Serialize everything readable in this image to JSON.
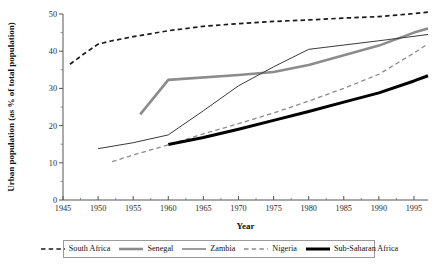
{
  "chart_data": {
    "type": "line",
    "title": "",
    "xlabel": "Year",
    "ylabel": "Urban population (as % of total population)",
    "xlim": [
      1945,
      1997
    ],
    "ylim": [
      0,
      50
    ],
    "xticks": [
      1945,
      1950,
      1955,
      1960,
      1965,
      1970,
      1975,
      1980,
      1985,
      1990,
      1995
    ],
    "xtick_labels": [
      "1945",
      "1950",
      "1955",
      "1960",
      "1965",
      "1970",
      "1975",
      "1980",
      "1985",
      "1990",
      "1995"
    ],
    "yticks": [
      0,
      10,
      20,
      30,
      40,
      50
    ],
    "ytick_labels": [
      "0",
      "10",
      "20",
      "30",
      "40",
      "50"
    ],
    "minor_ticks": true,
    "grid": false,
    "legend_position": "bottom",
    "series": [
      {
        "name": "South Africa",
        "color": "#1a1a1a",
        "style": "dashed",
        "width": 1.7,
        "x": [
          1946,
          1948,
          1950,
          1952,
          1955,
          1960,
          1965,
          1970,
          1975,
          1980,
          1985,
          1990,
          1995,
          1997
        ],
        "values": [
          36.5,
          39.3,
          41.9,
          42.8,
          43.9,
          45.5,
          46.7,
          47.4,
          48.0,
          48.4,
          48.9,
          49.3,
          50.1,
          50.5
        ]
      },
      {
        "name": "Senegal",
        "color": "#8c8c8c",
        "style": "solid",
        "width": 2.6,
        "x": [
          1956,
          1960,
          1970,
          1975,
          1980,
          1990,
          1995,
          1997
        ],
        "values": [
          23.0,
          32.3,
          33.6,
          34.4,
          36.3,
          41.5,
          45.0,
          46.1
        ]
      },
      {
        "name": "Zambia",
        "color": "#3a3a3a",
        "style": "solid",
        "width": 1.0,
        "x": [
          1950,
          1955,
          1960,
          1965,
          1970,
          1975,
          1980,
          1990,
          1995,
          1997
        ],
        "values": [
          13.8,
          15.4,
          17.5,
          24.0,
          30.7,
          35.8,
          40.5,
          42.8,
          44.0,
          44.5
        ]
      },
      {
        "name": "Nigeria",
        "color": "#8c8c8c",
        "style": "dashed",
        "width": 1.3,
        "x": [
          1952,
          1955,
          1960,
          1965,
          1970,
          1975,
          1980,
          1985,
          1990,
          1995,
          1997
        ],
        "values": [
          10.3,
          12.1,
          14.8,
          17.8,
          20.5,
          23.4,
          26.6,
          30.0,
          33.8,
          39.5,
          42.0
        ]
      },
      {
        "name": "Sub-Saharan Africa",
        "color": "#000000",
        "style": "solid",
        "width": 3.0,
        "x": [
          1960,
          1965,
          1970,
          1975,
          1980,
          1985,
          1990,
          1995,
          1997
        ],
        "values": [
          14.9,
          16.8,
          19.0,
          21.4,
          23.8,
          26.3,
          28.8,
          32.0,
          33.4
        ]
      }
    ]
  },
  "legend": {
    "entries": [
      {
        "label": "South Africa"
      },
      {
        "label": "Senegal"
      },
      {
        "label": "Zambia"
      },
      {
        "label": "Nigeria"
      },
      {
        "label": "Sub-Saharan Africa"
      }
    ]
  }
}
